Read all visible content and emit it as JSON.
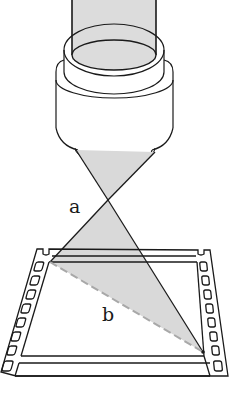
{
  "figure": {
    "labels": {
      "a": "a",
      "b": "b"
    },
    "colors": {
      "stroke": "#1a1a1a",
      "shade": "#d9d9d9",
      "dashed": "#a8a8a8",
      "background": "#ffffff"
    },
    "parts": [
      "lens-barrel",
      "lens-housing",
      "light-cone",
      "film-strip",
      "film-frame",
      "sprocket-holes",
      "dashed-diagonal-b"
    ]
  }
}
